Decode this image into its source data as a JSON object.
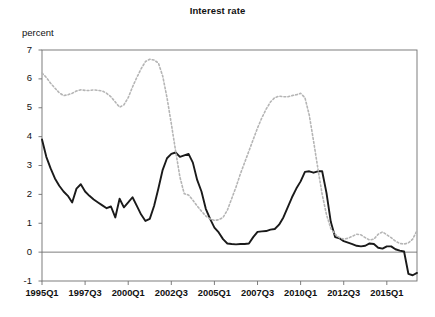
{
  "chart_data": {
    "type": "line",
    "title": "Interest rate",
    "ylabel": "percent",
    "xlabel": "",
    "ylim": [
      -1,
      7
    ],
    "yticks": [
      7,
      6,
      5,
      4,
      3,
      2,
      1,
      0,
      -1
    ],
    "ytick_labels": [
      "7",
      "6",
      "5",
      "4",
      "3",
      "2",
      "1",
      "0",
      "-1"
    ],
    "grid": false,
    "zero_line": true,
    "legend": "none",
    "x_axis_type": "quarterly",
    "x_start": "1995Q1",
    "x_end": "2016Q4",
    "xtick_labels": [
      "1995Q1",
      "1997Q3",
      "2000Q1",
      "2002Q3",
      "2005Q1",
      "2007Q3",
      "2010Q1",
      "2012Q3",
      "2015Q1"
    ],
    "xtick_indices": [
      0,
      10,
      20,
      30,
      40,
      50,
      60,
      70,
      80
    ],
    "n_points": 88,
    "series": [
      {
        "name": "short-term rate",
        "style": "solid",
        "color": "#1a1a1a",
        "values": [
          3.9,
          3.3,
          2.9,
          2.55,
          2.3,
          2.1,
          1.95,
          1.72,
          2.2,
          2.35,
          2.1,
          1.95,
          1.82,
          1.72,
          1.62,
          1.52,
          1.58,
          1.2,
          1.85,
          1.55,
          1.72,
          1.9,
          1.6,
          1.3,
          1.08,
          1.15,
          1.6,
          2.2,
          2.85,
          3.25,
          3.4,
          3.45,
          3.3,
          3.35,
          3.4,
          3.1,
          2.5,
          2.1,
          1.5,
          1.15,
          0.85,
          0.68,
          0.45,
          0.3,
          0.28,
          0.27,
          0.28,
          0.28,
          0.3,
          0.52,
          0.7,
          0.72,
          0.73,
          0.78,
          0.8,
          0.95,
          1.2,
          1.55,
          1.9,
          2.2,
          2.45,
          2.78,
          2.8,
          2.75,
          2.8,
          2.8,
          2.05,
          1.05,
          0.52,
          0.48,
          0.38,
          0.33,
          0.28,
          0.22,
          0.2,
          0.22,
          0.3,
          0.28,
          0.15,
          0.12,
          0.2,
          0.2,
          0.1,
          0.05,
          0.02,
          -0.75,
          -0.8,
          -0.72
        ]
      },
      {
        "name": "long-term rate",
        "style": "dashed",
        "color": "#b5b5b5",
        "values": [
          6.2,
          6.05,
          5.85,
          5.68,
          5.52,
          5.42,
          5.45,
          5.5,
          5.58,
          5.62,
          5.6,
          5.6,
          5.62,
          5.6,
          5.58,
          5.5,
          5.38,
          5.2,
          5.02,
          5.1,
          5.35,
          5.72,
          6.05,
          6.35,
          6.6,
          6.68,
          6.65,
          6.55,
          6.1,
          5.35,
          4.45,
          3.5,
          2.6,
          2.02,
          1.98,
          1.8,
          1.6,
          1.42,
          1.25,
          1.15,
          1.1,
          1.12,
          1.2,
          1.45,
          1.85,
          2.25,
          2.7,
          3.1,
          3.5,
          3.9,
          4.3,
          4.65,
          4.95,
          5.2,
          5.35,
          5.4,
          5.38,
          5.38,
          5.42,
          5.45,
          5.5,
          5.35,
          4.75,
          3.85,
          2.9,
          2.0,
          1.3,
          0.82,
          0.62,
          0.5,
          0.45,
          0.48,
          0.55,
          0.62,
          0.6,
          0.5,
          0.42,
          0.45,
          0.62,
          0.7,
          0.6,
          0.5,
          0.38,
          0.3,
          0.28,
          0.32,
          0.45,
          0.75
        ]
      }
    ]
  }
}
